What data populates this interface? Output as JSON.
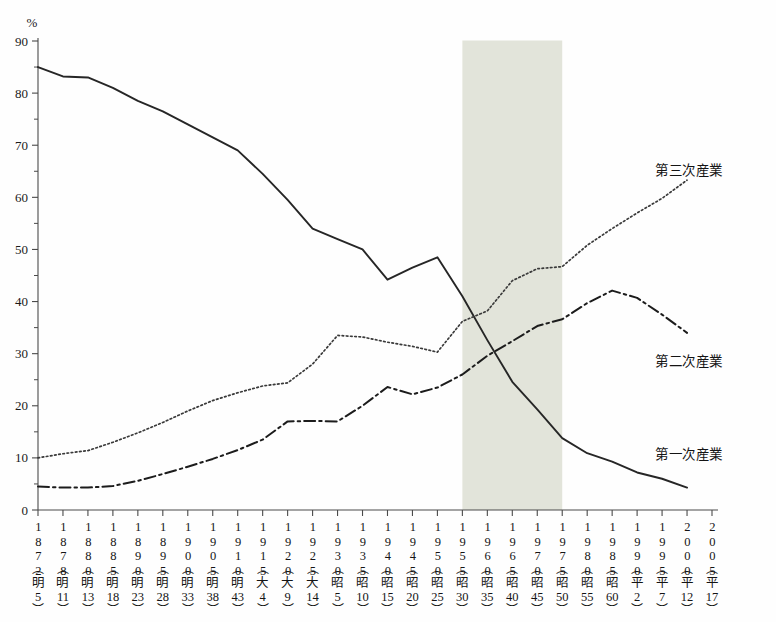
{
  "axis": {
    "unit_label": "%",
    "y_ticks": [
      0,
      10,
      20,
      30,
      40,
      50,
      60,
      70,
      80,
      90
    ],
    "y_minor_ticks": [
      5,
      15,
      25,
      35,
      45,
      55,
      65,
      75,
      85
    ],
    "ylim": [
      0,
      90
    ],
    "x_labels": [
      {
        "year": "1872",
        "era_char": "明",
        "era_num": "5"
      },
      {
        "year": "1878",
        "era_char": "明",
        "era_num": "11"
      },
      {
        "year": "1880",
        "era_char": "明",
        "era_num": "13"
      },
      {
        "year": "1885",
        "era_char": "明",
        "era_num": "18"
      },
      {
        "year": "1890",
        "era_char": "明",
        "era_num": "23"
      },
      {
        "year": "1895",
        "era_char": "明",
        "era_num": "28"
      },
      {
        "year": "1900",
        "era_char": "明",
        "era_num": "33"
      },
      {
        "year": "1905",
        "era_char": "明",
        "era_num": "38"
      },
      {
        "year": "1910",
        "era_char": "明",
        "era_num": "43"
      },
      {
        "year": "1915",
        "era_char": "大",
        "era_num": "4"
      },
      {
        "year": "1920",
        "era_char": "大",
        "era_num": "9"
      },
      {
        "year": "1925",
        "era_char": "大",
        "era_num": "14"
      },
      {
        "year": "1930",
        "era_char": "昭",
        "era_num": "5"
      },
      {
        "year": "1935",
        "era_char": "昭",
        "era_num": "10"
      },
      {
        "year": "1940",
        "era_char": "昭",
        "era_num": "15"
      },
      {
        "year": "1945",
        "era_char": "昭",
        "era_num": "20"
      },
      {
        "year": "1950",
        "era_char": "昭",
        "era_num": "25"
      },
      {
        "year": "1955",
        "era_char": "昭",
        "era_num": "30"
      },
      {
        "year": "1960",
        "era_char": "昭",
        "era_num": "35"
      },
      {
        "year": "1965",
        "era_char": "昭",
        "era_num": "40"
      },
      {
        "year": "1970",
        "era_char": "昭",
        "era_num": "45"
      },
      {
        "year": "1975",
        "era_char": "昭",
        "era_num": "50"
      },
      {
        "year": "1980",
        "era_char": "昭",
        "era_num": "55"
      },
      {
        "year": "1985",
        "era_char": "昭",
        "era_num": "60"
      },
      {
        "year": "1990",
        "era_char": "平",
        "era_num": "2"
      },
      {
        "year": "1995",
        "era_char": "平",
        "era_num": "7"
      },
      {
        "year": "2000",
        "era_char": "平",
        "era_num": "12"
      },
      {
        "year": "2005",
        "era_char": "平",
        "era_num": "17"
      }
    ]
  },
  "series_labels": {
    "tertiary": "第三次産業",
    "secondary": "第二次産業",
    "primary": "第一次産業"
  },
  "highlight": {
    "from_year": 1955,
    "to_year": 1975,
    "color": "#e2e4da"
  },
  "colors": {
    "primary_line": "#262626",
    "secondary_line": "#1c1c1c",
    "tertiary_line": "#3a3a3a",
    "axis": "#4a4a4a",
    "text": "#141414"
  },
  "chart_data": {
    "type": "line",
    "title": "",
    "xlabel": "",
    "ylabel": "%",
    "ylim": [
      0,
      90
    ],
    "grid": false,
    "legend_position": "right-inline",
    "x": [
      1872,
      1878,
      1880,
      1885,
      1890,
      1895,
      1900,
      1905,
      1910,
      1915,
      1920,
      1925,
      1930,
      1935,
      1940,
      1945,
      1950,
      1955,
      1960,
      1965,
      1970,
      1975,
      1980,
      1985,
      1990,
      1995,
      2000
    ],
    "series": [
      {
        "name": "第一次産業",
        "style": "solid",
        "values": [
          85.0,
          83.2,
          83.0,
          81.0,
          78.5,
          76.5,
          74.0,
          71.5,
          69.0,
          64.5,
          59.5,
          54.0,
          52.0,
          50.0,
          44.2,
          46.5,
          48.5,
          41.0,
          32.6,
          24.6,
          19.3,
          13.8,
          10.9,
          9.3,
          7.2,
          6.0,
          4.3
        ]
      },
      {
        "name": "第二次産業",
        "style": "dash-dot",
        "values": [
          4.5,
          4.3,
          4.3,
          4.6,
          5.6,
          6.9,
          8.3,
          9.8,
          11.5,
          13.5,
          17.0,
          17.1,
          17.0,
          20.0,
          23.6,
          22.2,
          23.5,
          26.0,
          29.6,
          32.4,
          35.3,
          36.6,
          39.7,
          42.1,
          40.7,
          37.5,
          34.0
        ]
      },
      {
        "name": "第三次産業",
        "style": "dotted",
        "values": [
          10.0,
          10.8,
          11.4,
          13.0,
          14.8,
          16.8,
          19.0,
          21.0,
          22.5,
          23.8,
          24.4,
          28.0,
          33.5,
          33.2,
          32.2,
          31.4,
          30.3,
          36.2,
          38.2,
          44.0,
          46.3,
          46.7,
          50.8,
          54.0,
          57.0,
          59.8,
          63.3
        ]
      }
    ]
  }
}
